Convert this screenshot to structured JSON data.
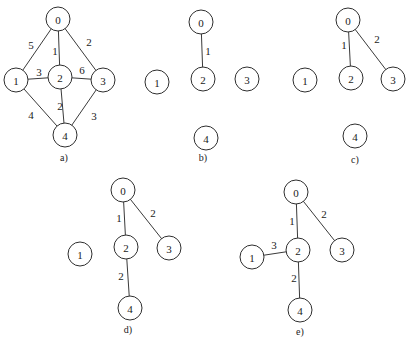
{
  "node_radius": 12,
  "panels": [
    {
      "id": "a",
      "label": "a)",
      "label_pos": [
        64,
        157
      ],
      "nodes": [
        {
          "id": "0",
          "x": 58,
          "y": 19
        },
        {
          "id": "1",
          "x": 16,
          "y": 80
        },
        {
          "id": "2",
          "x": 60,
          "y": 77
        },
        {
          "id": "3",
          "x": 103,
          "y": 80
        },
        {
          "id": "4",
          "x": 65,
          "y": 135
        }
      ],
      "edges": [
        {
          "from": "0",
          "to": "1",
          "weight": "5",
          "lx": 31,
          "ly": 45
        },
        {
          "from": "0",
          "to": "2",
          "weight": "1",
          "lx": 55,
          "ly": 51
        },
        {
          "from": "0",
          "to": "3",
          "weight": "2",
          "lx": 89,
          "ly": 42
        },
        {
          "from": "1",
          "to": "2",
          "weight": "3",
          "lx": 39,
          "ly": 72
        },
        {
          "from": "2",
          "to": "3",
          "weight": "6",
          "lx": 82,
          "ly": 70
        },
        {
          "from": "1",
          "to": "4",
          "weight": "4",
          "lx": 31,
          "ly": 115
        },
        {
          "from": "2",
          "to": "4",
          "weight": "2",
          "lx": 60,
          "ly": 106
        },
        {
          "from": "3",
          "to": "4",
          "weight": "3",
          "lx": 94,
          "ly": 116
        }
      ]
    },
    {
      "id": "b",
      "label": "b)",
      "label_pos": [
        203,
        157
      ],
      "nodes": [
        {
          "id": "0",
          "x": 201,
          "y": 22
        },
        {
          "id": "1",
          "x": 157,
          "y": 82
        },
        {
          "id": "2",
          "x": 203,
          "y": 79
        },
        {
          "id": "3",
          "x": 247,
          "y": 79
        },
        {
          "id": "4",
          "x": 206,
          "y": 138
        }
      ],
      "edges": [
        {
          "from": "0",
          "to": "2",
          "weight": "1",
          "lx": 208,
          "ly": 51
        }
      ]
    },
    {
      "id": "c",
      "label": "c)",
      "label_pos": [
        355,
        159
      ],
      "nodes": [
        {
          "id": "0",
          "x": 348,
          "y": 20
        },
        {
          "id": "1",
          "x": 305,
          "y": 80
        },
        {
          "id": "2",
          "x": 351,
          "y": 78
        },
        {
          "id": "3",
          "x": 393,
          "y": 79
        },
        {
          "id": "4",
          "x": 355,
          "y": 136
        }
      ],
      "edges": [
        {
          "from": "0",
          "to": "2",
          "weight": "1",
          "lx": 344,
          "ly": 45
        },
        {
          "from": "0",
          "to": "3",
          "weight": "2",
          "lx": 377,
          "ly": 39
        }
      ]
    },
    {
      "id": "d",
      "label": "d)",
      "label_pos": [
        128,
        329
      ],
      "nodes": [
        {
          "id": "0",
          "x": 123,
          "y": 190
        },
        {
          "id": "1",
          "x": 80,
          "y": 254
        },
        {
          "id": "2",
          "x": 126,
          "y": 247
        },
        {
          "id": "3",
          "x": 169,
          "y": 248
        },
        {
          "id": "4",
          "x": 130,
          "y": 308
        }
      ],
      "edges": [
        {
          "from": "0",
          "to": "2",
          "weight": "1",
          "lx": 119,
          "ly": 218
        },
        {
          "from": "0",
          "to": "3",
          "weight": "2",
          "lx": 153,
          "ly": 213
        },
        {
          "from": "2",
          "to": "4",
          "weight": "2",
          "lx": 121,
          "ly": 276
        }
      ]
    },
    {
      "id": "e",
      "label": "e)",
      "label_pos": [
        300,
        331
      ],
      "nodes": [
        {
          "id": "0",
          "x": 296,
          "y": 192
        },
        {
          "id": "1",
          "x": 252,
          "y": 257
        },
        {
          "id": "2",
          "x": 298,
          "y": 250
        },
        {
          "id": "3",
          "x": 342,
          "y": 250
        },
        {
          "id": "4",
          "x": 300,
          "y": 310
        }
      ],
      "edges": [
        {
          "from": "0",
          "to": "2",
          "weight": "1",
          "lx": 292,
          "ly": 221
        },
        {
          "from": "0",
          "to": "3",
          "weight": "2",
          "lx": 324,
          "ly": 214
        },
        {
          "from": "1",
          "to": "2",
          "weight": "3",
          "lx": 274,
          "ly": 245
        },
        {
          "from": "2",
          "to": "4",
          "weight": "2",
          "lx": 294,
          "ly": 278
        }
      ]
    }
  ]
}
